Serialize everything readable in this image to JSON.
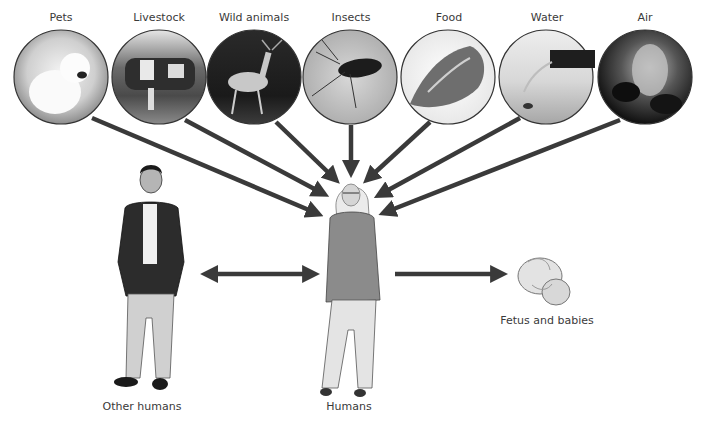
{
  "diagram": {
    "sources": [
      {
        "label": "Pets",
        "icon": "dog-photo",
        "cx": 61
      },
      {
        "label": "Livestock",
        "icon": "cow-photo",
        "cx": 159
      },
      {
        "label": "Wild animals",
        "icon": "deer-photo",
        "cx": 254
      },
      {
        "label": "Insects",
        "icon": "mosquito-photo",
        "cx": 350
      },
      {
        "label": "Food",
        "icon": "meat-photo",
        "cx": 448
      },
      {
        "label": "Water",
        "icon": "water-pipe-photo",
        "cx": 546
      },
      {
        "label": "Air",
        "icon": "smoke-photo",
        "cx": 645
      }
    ],
    "center": {
      "label": "Humans",
      "icon": "woman-figure"
    },
    "left": {
      "label": "Other humans",
      "icon": "man-figure"
    },
    "right": {
      "label": "Fetus and babies",
      "icon": "fetus-figure"
    },
    "relations": [
      {
        "from": "Other humans",
        "to": "Humans",
        "type": "bidirectional"
      },
      {
        "from": "Humans",
        "to": "Fetus and babies",
        "type": "directed"
      }
    ],
    "colors": {
      "arrow": "#3a3a3a",
      "circle_border": "#333333",
      "text": "#3a3a3a"
    }
  }
}
